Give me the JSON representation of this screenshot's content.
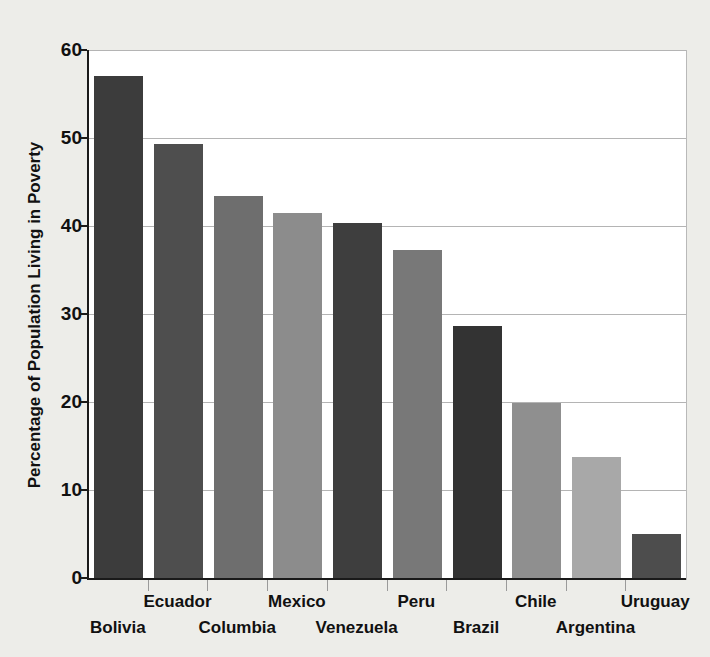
{
  "chart_data": {
    "type": "bar",
    "title": "",
    "xlabel": "",
    "ylabel": "Percentage of Population Living in Poverty",
    "ylim": [
      0,
      60
    ],
    "yticks": [
      0,
      10,
      20,
      30,
      40,
      50,
      60
    ],
    "ytick_labels": [
      "0",
      "10",
      "20",
      "30",
      "40",
      "50",
      "60"
    ],
    "grid": true,
    "legend": "none",
    "categories": [
      "Bolivia",
      "Ecuador",
      "Columbia",
      "Mexico",
      "Venezuela",
      "Peru",
      "Brazil",
      "Chile",
      "Argentina",
      "Uruguay"
    ],
    "values": [
      57.2,
      49.4,
      43.5,
      41.6,
      40.4,
      37.4,
      28.8,
      20.0,
      13.9,
      5.1
    ],
    "bar_colors": [
      "#3c3c3c",
      "#4e4e4e",
      "#6e6e6e",
      "#8c8c8c",
      "#3e3e3e",
      "#787878",
      "#333333",
      "#8f8f8f",
      "#a8a8a8",
      "#4d4d4d"
    ],
    "label_rows": [
      "bottom",
      "top",
      "bottom",
      "top",
      "bottom",
      "top",
      "bottom",
      "top",
      "bottom",
      "top"
    ]
  },
  "style": {
    "figure_background": "#edede9",
    "plot_background": "#ffffff",
    "gridline_color": "#b4b4b4",
    "axis_color": "#1a1a1a",
    "text_color": "#111111"
  }
}
